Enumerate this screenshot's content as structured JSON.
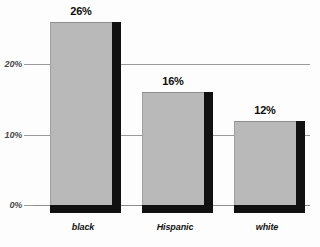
{
  "chart_data": {
    "type": "bar",
    "title": "",
    "subtitle": "",
    "xlabel": "",
    "ylabel": "",
    "categories": [
      "black",
      "Hispanic",
      "white"
    ],
    "values": [
      26,
      16,
      12
    ],
    "value_labels": [
      "26%",
      "16%",
      "12%"
    ],
    "ylim": [
      0,
      28
    ],
    "yticks": [
      0,
      10,
      20
    ],
    "ytick_labels": [
      "0%",
      "10%",
      "20%"
    ],
    "grid": true,
    "legend": false,
    "legend_position": "none",
    "series": [
      {
        "name": "",
        "values": [
          26,
          16,
          12
        ]
      }
    ],
    "style": {
      "bar_face": "#b9b9b9",
      "bar_shadow": "#111111",
      "grid_color": "#9a9a9a",
      "axis_text": "#4a4a4a",
      "label_text": "#0d0d0d",
      "background": "#fdfdfd",
      "three_d": true
    }
  }
}
